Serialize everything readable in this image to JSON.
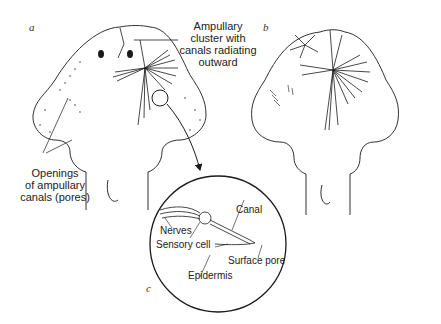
{
  "figure": {
    "panels": [
      {
        "id": "a",
        "label": "a"
      },
      {
        "id": "b",
        "label": "b"
      },
      {
        "id": "c",
        "label": "c"
      }
    ],
    "callouts": {
      "ampullary_cluster": [
        "Ampullary",
        "cluster with",
        "canals radiating",
        "outward"
      ],
      "openings": [
        "Openings",
        "of ampullary",
        "canals (pores)"
      ]
    },
    "inset_labels": {
      "canal": "Canal",
      "nerves": "Nerves",
      "sensory_cell": "Sensory cell",
      "surface_pore": "Surface pore",
      "epidermis": "Epidermis"
    }
  },
  "colors": {
    "ink": "#1a1a1a",
    "background": "#ffffff"
  }
}
